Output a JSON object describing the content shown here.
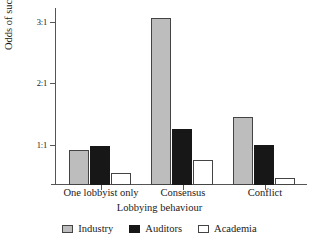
{
  "chart_data": {
    "type": "bar",
    "title": "",
    "xlabel": "Lobbying behaviour",
    "ylabel": "Odds of success",
    "categories": [
      "One lobbyist only",
      "Consensus",
      "Conflict"
    ],
    "series": [
      {
        "name": "Industry",
        "color": "#bdbdbd",
        "values": [
          0.92,
          3.05,
          1.45
        ]
      },
      {
        "name": "Auditors",
        "color": "#171717",
        "values": [
          0.98,
          1.26,
          1.0
        ]
      },
      {
        "name": "Academia",
        "color": "#ffffff",
        "values": [
          0.55,
          0.76,
          0.46
        ]
      }
    ],
    "ylim": [
      0.35,
      3.22
    ],
    "yticks": [
      1,
      2,
      3
    ],
    "ytick_labels": [
      "1:1",
      "2:1",
      "3:1"
    ],
    "grid": false,
    "legend_position": "bottom"
  },
  "axes": {
    "y_title": "Odds of success",
    "x_title": "Lobbying behaviour",
    "y_tick_1": "1:1",
    "y_tick_2": "2:1",
    "y_tick_3": "3:1"
  },
  "categories": {
    "cat_0": "One lobbyist only",
    "cat_1": "Consensus",
    "cat_2": "Conflict"
  },
  "legend": {
    "item_0": "Industry",
    "item_1": "Auditors",
    "item_2": "Academia"
  }
}
